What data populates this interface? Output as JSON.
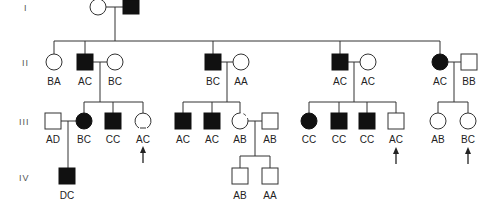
{
  "diagram": {
    "type": "pedigree",
    "generations": [
      "I",
      "II",
      "III",
      "IV"
    ],
    "individuals": [
      {
        "id": "I-1",
        "gen": "I",
        "sex": "female",
        "affected": false,
        "genotype": "",
        "x": 98,
        "y": 7
      },
      {
        "id": "I-2",
        "gen": "I",
        "sex": "male",
        "affected": true,
        "genotype": "",
        "x": 131,
        "y": 7
      },
      {
        "id": "II-1",
        "gen": "II",
        "sex": "female",
        "affected": false,
        "genotype": "BA",
        "x": 54,
        "y": 62
      },
      {
        "id": "II-2",
        "gen": "II",
        "sex": "male",
        "affected": true,
        "genotype": "AC",
        "x": 85,
        "y": 62
      },
      {
        "id": "II-3",
        "gen": "II",
        "sex": "female",
        "affected": false,
        "genotype": "BC",
        "x": 115,
        "y": 62
      },
      {
        "id": "II-4",
        "gen": "II",
        "sex": "male",
        "affected": true,
        "genotype": "BC",
        "x": 213,
        "y": 62
      },
      {
        "id": "II-5",
        "gen": "II",
        "sex": "female",
        "affected": false,
        "genotype": "AA",
        "x": 241,
        "y": 62
      },
      {
        "id": "II-6",
        "gen": "II",
        "sex": "male",
        "affected": true,
        "genotype": "AC",
        "x": 340,
        "y": 62
      },
      {
        "id": "II-7",
        "gen": "II",
        "sex": "female",
        "affected": false,
        "genotype": "AC",
        "x": 368,
        "y": 62
      },
      {
        "id": "II-8",
        "gen": "II",
        "sex": "female",
        "affected": true,
        "genotype": "AC",
        "x": 440,
        "y": 62
      },
      {
        "id": "II-9",
        "gen": "II",
        "sex": "male",
        "affected": false,
        "genotype": "BB",
        "x": 469,
        "y": 62
      },
      {
        "id": "III-1",
        "gen": "III",
        "sex": "male",
        "affected": false,
        "genotype": "AD",
        "x": 53,
        "y": 121
      },
      {
        "id": "III-2",
        "gen": "III",
        "sex": "female",
        "affected": true,
        "genotype": "BC",
        "x": 84,
        "y": 121
      },
      {
        "id": "III-3",
        "gen": "III",
        "sex": "male",
        "affected": true,
        "genotype": "CC",
        "x": 113,
        "y": 121
      },
      {
        "id": "III-4",
        "gen": "III",
        "sex": "female",
        "affected": false,
        "genotype": "AC",
        "x": 143,
        "y": 121,
        "proband": true,
        "partial_marking": true
      },
      {
        "id": "III-5",
        "gen": "III",
        "sex": "male",
        "affected": true,
        "genotype": "AC",
        "x": 183,
        "y": 121
      },
      {
        "id": "III-6",
        "gen": "III",
        "sex": "male",
        "affected": true,
        "genotype": "AC",
        "x": 212,
        "y": 121
      },
      {
        "id": "III-7",
        "gen": "III",
        "sex": "female",
        "affected": false,
        "genotype": "AB",
        "x": 240,
        "y": 121,
        "partial_marking": true
      },
      {
        "id": "III-8",
        "gen": "III",
        "sex": "male",
        "affected": false,
        "genotype": "AB",
        "x": 270,
        "y": 121
      },
      {
        "id": "III-9",
        "gen": "III",
        "sex": "female",
        "affected": true,
        "genotype": "CC",
        "x": 309,
        "y": 121
      },
      {
        "id": "III-10",
        "gen": "III",
        "sex": "male",
        "affected": true,
        "genotype": "CC",
        "x": 339,
        "y": 121
      },
      {
        "id": "III-11",
        "gen": "III",
        "sex": "male",
        "affected": true,
        "genotype": "CC",
        "x": 367,
        "y": 121
      },
      {
        "id": "III-12",
        "gen": "III",
        "sex": "male",
        "affected": false,
        "genotype": "AC",
        "x": 396,
        "y": 121,
        "proband": true
      },
      {
        "id": "III-13",
        "gen": "III",
        "sex": "female",
        "affected": false,
        "genotype": "AB",
        "x": 438,
        "y": 121
      },
      {
        "id": "III-14",
        "gen": "III",
        "sex": "female",
        "affected": false,
        "genotype": "BC",
        "x": 468,
        "y": 121,
        "proband": true
      },
      {
        "id": "IV-1",
        "gen": "IV",
        "sex": "male",
        "affected": true,
        "genotype": "DC",
        "x": 67,
        "y": 176
      },
      {
        "id": "IV-2",
        "gen": "IV",
        "sex": "male",
        "affected": false,
        "genotype": "AB",
        "x": 240,
        "y": 176
      },
      {
        "id": "IV-3",
        "gen": "IV",
        "sex": "male",
        "affected": false,
        "genotype": "AA",
        "x": 270,
        "y": 176
      }
    ],
    "labels": {
      "gen_I": "I",
      "gen_II": "II",
      "gen_III": "III",
      "gen_IV": "IV",
      "II_1": "BA",
      "II_2": "AC",
      "II_3": "BC",
      "II_4": "BC",
      "II_5": "AA",
      "II_6": "AC",
      "II_7": "AC",
      "II_8": "AC",
      "II_9": "BB",
      "III_1": "AD",
      "III_2": "BC",
      "III_3": "CC",
      "III_4": "AC",
      "III_5": "AC",
      "III_6": "AC",
      "III_7": "AB",
      "III_8": "AB",
      "III_9": "CC",
      "III_10": "CC",
      "III_11": "CC",
      "III_12": "AC",
      "III_13": "AB",
      "III_14": "BC",
      "IV_1": "DC",
      "IV_2": "AB",
      "IV_3": "AA"
    },
    "colors": {
      "affected": "#111111",
      "unaffected": "#ffffff",
      "line": "#333333"
    }
  }
}
